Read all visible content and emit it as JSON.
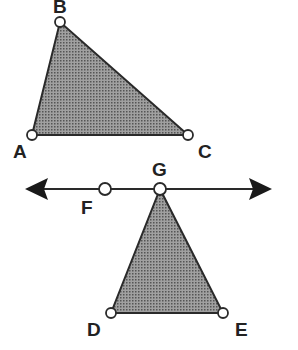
{
  "diagram": {
    "colors": {
      "fill": "#8a8a8a",
      "stroke": "#2a2a2a",
      "point_fill": "#ffffff"
    },
    "triangle_abc": {
      "points": {
        "A": [
          32,
          135
        ],
        "B": [
          60,
          22
        ],
        "C": [
          188,
          135
        ]
      },
      "labels": {
        "A": "A",
        "B": "B",
        "C": "C"
      }
    },
    "line": {
      "y": 189,
      "x_start": 25,
      "x_end": 272,
      "points": {
        "F": [
          105,
          189
        ],
        "G": [
          160,
          189
        ]
      },
      "labels": {
        "F": "F",
        "G": "G"
      }
    },
    "triangle_dge": {
      "points": {
        "D": [
          111,
          313
        ],
        "G": [
          160,
          189
        ],
        "E": [
          223,
          313
        ]
      },
      "labels": {
        "D": "D",
        "E": "E"
      }
    }
  }
}
